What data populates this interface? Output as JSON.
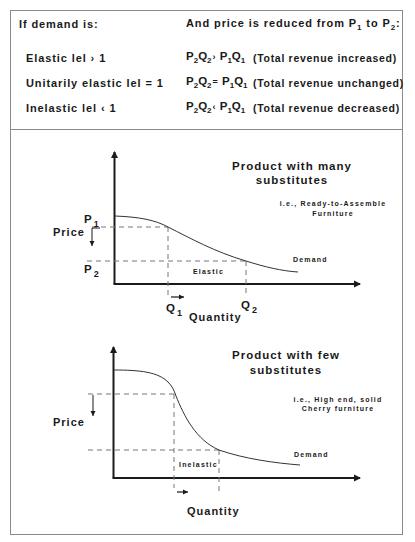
{
  "table": {
    "header_left": "If demand is:",
    "header_right_prefix": "And price is reduced from P",
    "header_right_sub1": "1",
    "header_right_mid": " to P",
    "header_right_sub2": "2",
    "header_right_suffix": ":",
    "rows": [
      {
        "condition": "Elastic  lel › 1",
        "lhs_p": "P",
        "lhs_p_sub": "2",
        "lhs_q": "Q",
        "lhs_q_sub": "2",
        "operator": "›",
        "rhs_p": "P",
        "rhs_p_sub": "1",
        "rhs_q": "Q",
        "rhs_q_sub": "1",
        "result": "(Total revenue increased)"
      },
      {
        "condition": "Unitarily elastic  lel = 1",
        "lhs_p": "P",
        "lhs_p_sub": "2",
        "lhs_q": "Q",
        "lhs_q_sub": "2",
        "operator": "=",
        "rhs_p": "P",
        "rhs_p_sub": "1",
        "rhs_q": "Q",
        "rhs_q_sub": "1",
        "result": "(Total revenue unchanged)"
      },
      {
        "condition": "Inelastic  lel ‹ 1",
        "lhs_p": "P",
        "lhs_p_sub": "2",
        "lhs_q": "Q",
        "lhs_q_sub": "2",
        "operator": "‹",
        "rhs_p": "P",
        "rhs_p_sub": "1",
        "rhs_q": "Q",
        "rhs_q_sub": "1",
        "result": "(Total revenue decreased)"
      }
    ]
  },
  "diagrams": [
    {
      "title_line1": "Product with many",
      "title_line2": "substitutes",
      "example_line1": "i.e., Ready-to-Assemble",
      "example_line2": "Furniture",
      "y_label": "Price",
      "x_label": "Quantity",
      "curve_label": "Demand",
      "region_label": "Elastic",
      "p1": "P",
      "p1_sub": "1",
      "p2": "P",
      "p2_sub": "2",
      "q1": "Q",
      "q1_sub": "1",
      "q2": "Q",
      "q2_sub": "2"
    },
    {
      "title_line1": "Product with few",
      "title_line2": "substitutes",
      "example_line1": "i.e., High end, solid",
      "example_line2": "Cherry furniture",
      "y_label": "Price",
      "x_label": "Quantity",
      "curve_label": "Demand",
      "region_label": "Inelastic"
    }
  ],
  "colors": {
    "ink": "#1a1a1a",
    "frame": "#8a8a8a",
    "dash": "#777777"
  }
}
